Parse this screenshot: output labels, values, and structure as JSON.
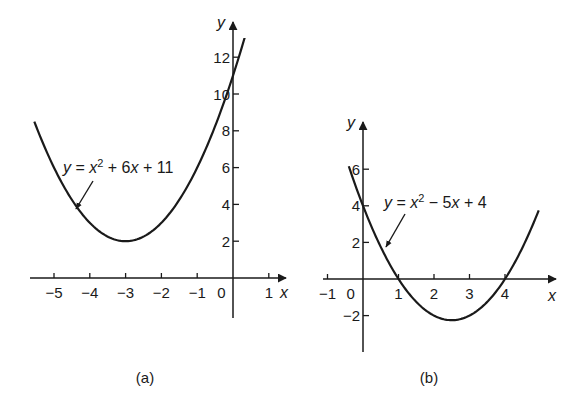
{
  "chart_data": [
    {
      "id": "a",
      "type": "line",
      "caption": "(a)",
      "equation": "y = x² + 6x + 11",
      "equation_parts": [
        "y",
        " = ",
        "x",
        "2",
        " + 6",
        "x",
        " + 11"
      ],
      "function": {
        "a": 1,
        "b": 6,
        "c": 11
      },
      "x_domain": [
        -5.55,
        0.5
      ],
      "xlabel": "x",
      "ylabel": "y",
      "x_ticks": [
        -5,
        -4,
        -3,
        -2,
        -1,
        0,
        1
      ],
      "x_tick_labels": [
        "−5",
        "−4",
        "−3",
        "−2",
        "−1",
        "0",
        "1"
      ],
      "y_ticks": [
        2,
        4,
        6,
        8,
        10,
        12
      ],
      "y_tick_labels": [
        "2",
        "4",
        "6",
        "8",
        "10",
        "12"
      ],
      "xlim": [
        -5.6,
        1.4
      ],
      "ylim": [
        0,
        13.5
      ],
      "grid": false,
      "vertex": {
        "x": -3,
        "y": 2
      },
      "y_intercept": 11,
      "points": [
        {
          "x": -5.5,
          "y": 8.25
        },
        {
          "x": -5,
          "y": 6
        },
        {
          "x": -4,
          "y": 3
        },
        {
          "x": -3,
          "y": 2
        },
        {
          "x": -2,
          "y": 3
        },
        {
          "x": -1,
          "y": 6
        },
        {
          "x": 0,
          "y": 11
        },
        {
          "x": 0.5,
          "y": 14.25
        }
      ]
    },
    {
      "id": "b",
      "type": "line",
      "caption": "(b)",
      "equation": "y = x² − 5x + 4",
      "equation_parts": [
        "y",
        " = ",
        "x",
        "2",
        " − 5",
        "x",
        " + 4"
      ],
      "function": {
        "a": 1,
        "b": -5,
        "c": 4
      },
      "x_domain": [
        -0.4,
        4.95
      ],
      "xlabel": "x",
      "ylabel": "y",
      "x_ticks": [
        -1,
        0,
        1,
        2,
        3,
        4
      ],
      "x_tick_labels": [
        "−1",
        "0",
        "1",
        "2",
        "3",
        "4"
      ],
      "y_ticks": [
        -2,
        2,
        4,
        6
      ],
      "y_tick_labels": [
        "−2",
        "2",
        "4",
        "6"
      ],
      "xlim": [
        -1.1,
        5.5
      ],
      "ylim": [
        -4,
        8.5
      ],
      "grid": false,
      "vertex": {
        "x": 2.5,
        "y": -2.25
      },
      "roots": [
        1,
        4
      ],
      "y_intercept": 4,
      "points": [
        {
          "x": -0.4,
          "y": 6.16
        },
        {
          "x": 0,
          "y": 4
        },
        {
          "x": 1,
          "y": 0
        },
        {
          "x": 2,
          "y": -2
        },
        {
          "x": 2.5,
          "y": -2.25
        },
        {
          "x": 3,
          "y": -2
        },
        {
          "x": 4,
          "y": 0
        },
        {
          "x": 4.95,
          "y": 3.75
        }
      ]
    }
  ],
  "layout": {
    "panels": [
      {
        "origin_px": [
          233,
          278
        ],
        "sx": 35.8,
        "sy": 18.4,
        "x_axis": {
          "from": 30,
          "to": 286
        },
        "y_axis": {
          "from": 318,
          "to": 22
        },
        "label_pos": [
          63,
          173
        ],
        "arrow": {
          "from": [
            93,
            181
          ],
          "to": [
            76,
            209
          ]
        },
        "caption_pos": [
          145,
          383
        ],
        "zero_label_pos": [
          -0.32,
          0
        ],
        "ylabel_pos": [
          -0.35,
          0
        ],
        "xlabel_after_last_tick": true
      },
      {
        "origin_px": [
          363,
          279
        ],
        "sx": 35.5,
        "sy": 18.3,
        "x_axis": {
          "from": 323,
          "to": 556
        },
        "y_axis": {
          "from": 352,
          "to": 122
        },
        "label_pos": [
          384,
          208
        ],
        "arrow": {
          "from": [
            405,
            214
          ],
          "to": [
            386,
            247
          ]
        },
        "caption_pos": [
          429,
          383
        ],
        "zero_label_pos": [
          -0.35,
          0
        ],
        "ylabel_pos": [
          -0.45,
          0
        ],
        "xlabel_after_last_tick": false
      }
    ],
    "stroke_color": "#1a1a1a"
  }
}
